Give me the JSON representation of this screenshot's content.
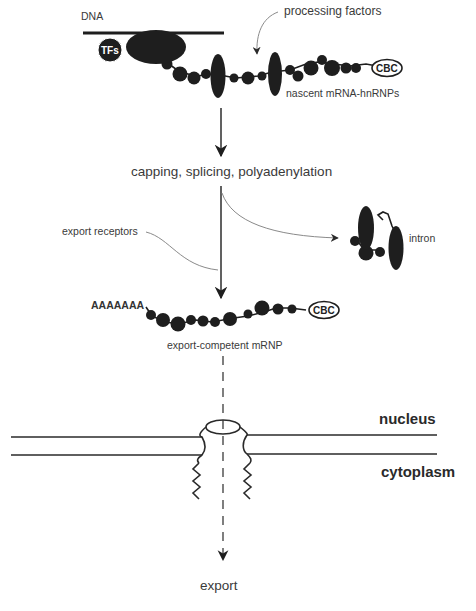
{
  "diagram": {
    "colors": {
      "ink": "#1e1e1e",
      "thin_line": "#8a8a8a",
      "text": "#3a3a3a",
      "background": "#ffffff"
    },
    "labels": {
      "dna": "DNA",
      "tfs": "TFs",
      "processing_factors": "processing factors",
      "nascent": "nascent mRNA-hnRNPs",
      "cbc_top": "CBC",
      "steps": "capping, splicing, polyadenylation",
      "export_receptors": "export receptors",
      "intron": "intron",
      "polya": "AAAAAAA",
      "cbc_bottom": "CBC",
      "mrnp": "export-competent mRNP",
      "nucleus": "nucleus",
      "cytoplasm": "cytoplasm",
      "export": "export"
    },
    "icons": {
      "pol2": "rna-polymerase-blob-icon",
      "cbc": "cap-binding-complex-icon",
      "bead": "hnrnp-bead-icon",
      "splicing_factor": "processing-factor-ellipse-icon",
      "pore": "nuclear-pore-complex-icon"
    },
    "nodes": [
      {
        "id": "transcription",
        "label": "nascent mRNA-hnRNPs"
      },
      {
        "id": "processing",
        "label": "capping, splicing, polyadenylation"
      },
      {
        "id": "intron",
        "label": "intron"
      },
      {
        "id": "mrnp",
        "label": "export-competent mRNP"
      },
      {
        "id": "export",
        "label": "export"
      }
    ],
    "edges": [
      {
        "from": "transcription",
        "to": "processing",
        "style": "solid-arrow"
      },
      {
        "from": "processing",
        "to": "mrnp",
        "style": "solid-arrow"
      },
      {
        "from": "processing",
        "to": "intron",
        "style": "curved-arrow"
      },
      {
        "from": "mrnp",
        "to": "export",
        "style": "dashed-arrow"
      }
    ]
  }
}
